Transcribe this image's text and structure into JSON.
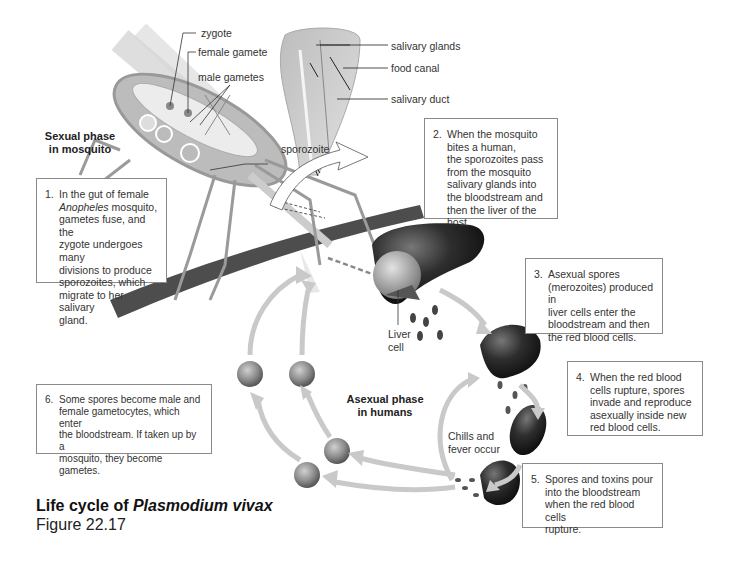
{
  "figure": {
    "title_prefix": "Life cycle of ",
    "title_species": "Plasmodium vivax",
    "figure_number": "Figure 22.17"
  },
  "phases": {
    "sexual": [
      "Sexual phase",
      "in mosquito"
    ],
    "asexual": [
      "Asexual phase",
      "in humans"
    ]
  },
  "mosquito_labels": {
    "zygote": "zygote",
    "female_gamete": "female gamete",
    "male_gametes": "male gametes",
    "sporozoite": "sporozoite"
  },
  "proboscis_labels": {
    "salivary_glands": "salivary glands",
    "food_canal": "food canal",
    "salivary_duct": "salivary duct"
  },
  "cycle_labels": {
    "liver_cell": [
      "Liver",
      "cell"
    ],
    "chills": [
      "Chills and",
      "fever occur"
    ]
  },
  "steps": [
    {
      "num": "1.",
      "lines": [
        "In the gut of female",
        "Anopheles mosquito,",
        "gametes fuse, and the",
        "zygote undergoes many",
        "divisions to produce",
        "sporozoites, which",
        "migrate to her salivary",
        "gland."
      ],
      "italic_word": "Anopheles",
      "after_italic": " mosquito,"
    },
    {
      "num": "2.",
      "lines": [
        "When the mosquito",
        "bites a human,",
        "the sporozoites pass",
        "from the mosquito",
        "salivary glands into",
        "the bloodstream and",
        "then the liver of the host."
      ]
    },
    {
      "num": "3.",
      "lines": [
        "Asexual spores",
        "(merozoites) produced in",
        "liver cells enter the",
        "bloodstream and then",
        "the red blood cells."
      ]
    },
    {
      "num": "4.",
      "lines": [
        "When the red blood",
        "cells rupture, spores",
        "invade and reproduce",
        "asexually inside new",
        "red blood cells."
      ]
    },
    {
      "num": "5.",
      "lines": [
        "Spores and toxins pour",
        "into the bloodstream",
        "when the red blood cells",
        "rupture."
      ]
    },
    {
      "num": "6.",
      "lines": [
        "Some spores become male and",
        "female gametocytes, which enter",
        "the bloodstream. If taken up by a",
        "mosquito, they become gametes."
      ]
    }
  ],
  "colors": {
    "arrow_fill": "#c9c9c9",
    "cell_fill": "#8f8f8f",
    "liver_dark": "#2b2b2b",
    "box_border": "#8a8a8a",
    "text": "#333333"
  }
}
